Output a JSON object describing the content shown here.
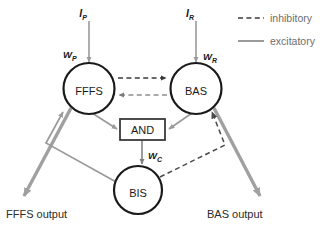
{
  "diagram": {
    "nodes": {
      "ffs": "FFFS",
      "bas": "BAS",
      "bis": "BIS",
      "and": "AND"
    },
    "inputs": {
      "ip_label": "I",
      "ip_sub": "P",
      "ir_label": "I",
      "ir_sub": "R"
    },
    "weights": {
      "wp_label": "W",
      "wp_sub": "P",
      "wr_label": "W",
      "wr_sub": "R",
      "wc_label": "W",
      "wc_sub": "C"
    },
    "outputs": {
      "left": "FFFS output",
      "right": "BAS output"
    },
    "legend": [
      {
        "key": "inhibitory",
        "label": "inhibitory",
        "style": "dashed",
        "color": "#3a3a3a"
      },
      {
        "key": "excitatory",
        "label": "excitatory",
        "style": "solid",
        "color": "#9a9a9a"
      }
    ],
    "colors": {
      "background": "#ffffff",
      "node_stroke": "#1a1a1a",
      "inhibitory_dark": "#3a3a3a",
      "inhibitory_gray": "#8f8f8f",
      "excitatory_gray": "#9a9a9a",
      "excitatory_thick": "#a0a0a0",
      "text": "#2b2b2b"
    }
  }
}
